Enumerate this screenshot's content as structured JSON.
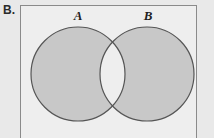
{
  "panel": {
    "letter": "B."
  },
  "diagram": {
    "type": "venn-two-set",
    "sets": [
      {
        "id": "A",
        "label": "A",
        "cx": 78,
        "cy": 74,
        "r": 47,
        "shaded": true
      },
      {
        "id": "B",
        "label": "B",
        "cx": 147,
        "cy": 74,
        "r": 47,
        "shaded": true
      }
    ],
    "intersection": {
      "label": "",
      "shaded": false
    }
  },
  "colors": {
    "page_background": "#e9e9e9",
    "box_background": "#eeeeee",
    "box_border": "#8a8a8a",
    "circle_fill": "#c8c8c8",
    "circle_stroke": "#555555",
    "intersection_fill": "#efefef",
    "label_text": "#1f1f1f",
    "panel_letter_text": "#2b2b2b"
  }
}
